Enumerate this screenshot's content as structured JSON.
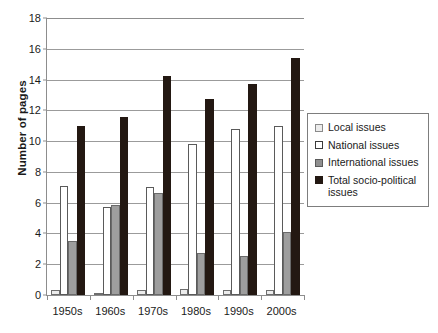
{
  "chart_data": {
    "type": "bar",
    "title": "",
    "xlabel": "",
    "ylabel": "Number of pages",
    "ylim": [
      0,
      18
    ],
    "yticks": [
      0,
      2,
      4,
      6,
      8,
      10,
      12,
      14,
      16,
      18
    ],
    "grid": true,
    "legend_position": "right",
    "categories": [
      "1950s",
      "1960s",
      "1970s",
      "1980s",
      "1990s",
      "2000s"
    ],
    "series": [
      {
        "name": "Local issues",
        "key": "local",
        "color": "#ececec",
        "values": [
          0.35,
          0.1,
          0.3,
          0.4,
          0.3,
          0.3
        ]
      },
      {
        "name": "National issues",
        "key": "national",
        "color": "#ffffff",
        "values": [
          7.1,
          5.75,
          7.05,
          9.8,
          10.8,
          11.0
        ]
      },
      {
        "name": "International issues",
        "key": "international",
        "color": "#9e9e9e",
        "values": [
          3.5,
          5.85,
          6.65,
          2.7,
          2.55,
          4.1
        ]
      },
      {
        "name": "Total socio-political issues",
        "key": "total",
        "color": "#231812",
        "values": [
          11.0,
          11.6,
          14.2,
          12.75,
          13.7,
          15.4
        ]
      }
    ]
  },
  "legend": {
    "items": [
      {
        "label": "Local issues",
        "swatch": "local"
      },
      {
        "label": "National issues",
        "swatch": "national"
      },
      {
        "label": "International issues",
        "swatch": "international"
      },
      {
        "label": "Total socio-political issues",
        "swatch": "total"
      }
    ]
  },
  "axis": {
    "y_title": "Number of pages"
  }
}
